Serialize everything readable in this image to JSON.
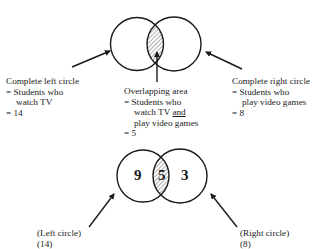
{
  "top_diagram": {
    "left_label": {
      "line1": "Complete left circle",
      "line2": "= Students who",
      "line3": "watch TV",
      "line4": "= 14"
    },
    "overlap_label": {
      "line1": "Overlapping area",
      "line2": "= Students who",
      "line3_a": "watch TV ",
      "line3_b": "and",
      "line4": "play video games",
      "line5": "= 5"
    },
    "right_label": {
      "line1": "Complete right circle",
      "line2": "= Students who",
      "line3": "play video games",
      "line4": "= 8"
    }
  },
  "bottom_diagram": {
    "left_only": "9",
    "overlap": "5",
    "right_only": "3",
    "left_label": {
      "line1": "(Left circle)",
      "line2": "(14)"
    },
    "right_label": {
      "line1": "(Right circle)",
      "line2": "(8)"
    }
  },
  "colors": {
    "stroke": "#1a1a1a",
    "background": "#ffffff"
  }
}
